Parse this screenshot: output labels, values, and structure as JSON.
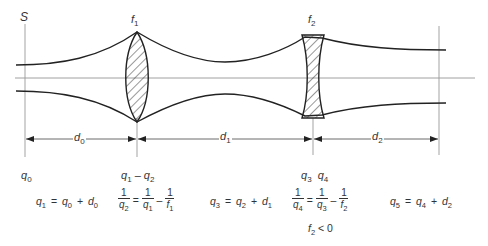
{
  "diagram": {
    "type": "gaussian-beam-lens-system",
    "colors": {
      "line": "#222222",
      "axis": "#777777",
      "hatch": "#333333",
      "text": "#333333"
    },
    "labels": {
      "source": "S",
      "lens1": {
        "base": "f",
        "sub": "1"
      },
      "lens2": {
        "base": "f",
        "sub": "2"
      },
      "d0": {
        "base": "d",
        "sub": "0"
      },
      "d1": {
        "base": "d",
        "sub": "1"
      },
      "d2": {
        "base": "d",
        "sub": "2"
      },
      "q0": {
        "base": "q",
        "sub": "0"
      },
      "q1_q2": {
        "a": "q",
        "a_sub": "1",
        "sep": "–",
        "b": "q",
        "b_sub": "2"
      },
      "q3_q4": {
        "a": "q",
        "a_sub": "3",
        "b": "q",
        "b_sub": "4"
      }
    },
    "equations": {
      "eq1": {
        "lhs": "q",
        "lhs_sub": "1",
        "eq": "=",
        "t1": "q",
        "t1_sub": "0",
        "op": "+",
        "t2": "d",
        "t2_sub": "0"
      },
      "eq2": {
        "one": "1",
        "lhs_den": "q",
        "lhs_den_sub": "2",
        "eq": "=",
        "r1_den": "q",
        "r1_den_sub": "1",
        "op": "–",
        "r2_den": "f",
        "r2_den_sub": "1"
      },
      "eq3": {
        "lhs": "q",
        "lhs_sub": "3",
        "eq": "=",
        "t1": "q",
        "t1_sub": "2",
        "op": "+",
        "t2": "d",
        "t2_sub": "1"
      },
      "eq4": {
        "one": "1",
        "lhs_den": "q",
        "lhs_den_sub": "4",
        "eq": "=",
        "r1_den": "q",
        "r1_den_sub": "3",
        "op": "–",
        "r2_den": "f",
        "r2_den_sub": "2"
      },
      "eq5": {
        "lhs": "q",
        "lhs_sub": "5",
        "eq": "=",
        "t1": "q",
        "t1_sub": "4",
        "op": "+",
        "t2": "d",
        "t2_sub": "2"
      },
      "condition": {
        "var": "f",
        "var_sub": "2",
        "rel": "< 0"
      }
    }
  }
}
